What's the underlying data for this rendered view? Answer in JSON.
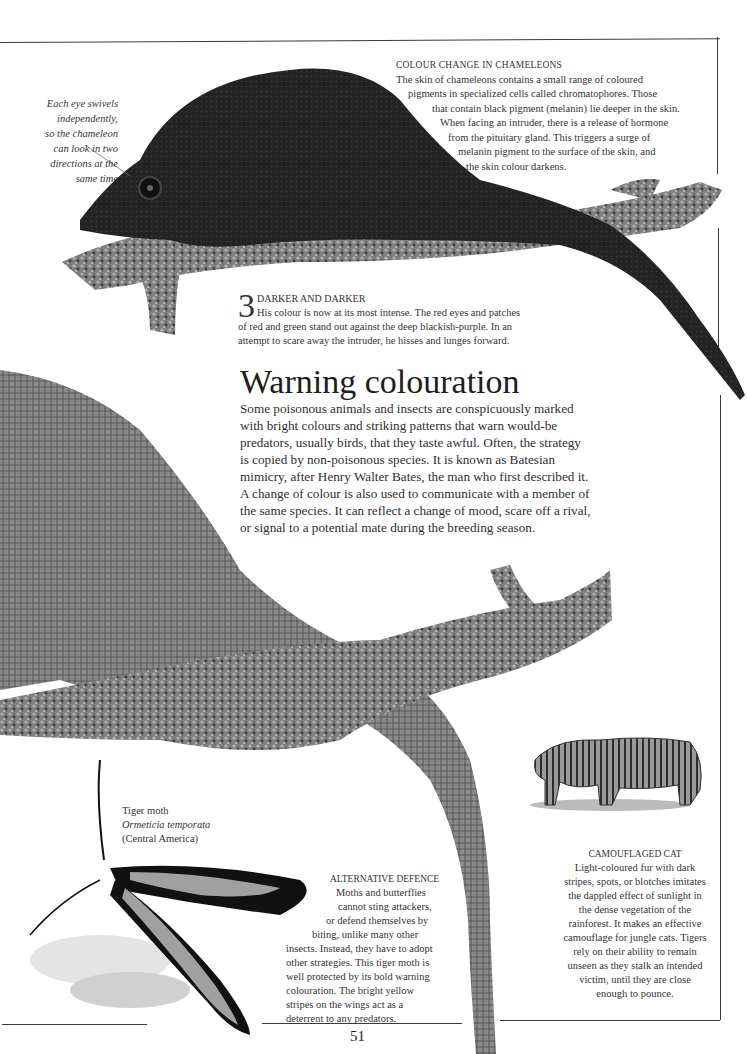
{
  "page": {
    "number": "51"
  },
  "eye_note": {
    "lines": [
      "Each eye swivels",
      "independently,",
      "so the chameleon",
      "can look in two",
      "directions at the",
      "same time"
    ]
  },
  "colour_change": {
    "heading": "COLOUR CHANGE IN CHAMELEONS",
    "lines": [
      "The skin of chameleons contains a small range of coloured",
      "pigments in specialized cells called chromatophores. Those",
      "that contain black pigment (melanin) lie deeper in the skin.",
      "When facing an intruder, there is a release of hormone",
      "from the pituitary gland. This triggers a surge of",
      "melanin pigment to the surface of the skin, and",
      "the skin colour darkens."
    ]
  },
  "darker": {
    "step_number": "3",
    "heading": "DARKER AND DARKER",
    "lines": [
      "His colour is now at its most intense. The red eyes and patches",
      "of red and green stand out against the deep blackish-purple. In an",
      "attempt to scare away the intruder, he hisses and lunges forward."
    ]
  },
  "warning": {
    "title": "Warning colouration",
    "lines": [
      "Some poisonous animals and insects are conspicuously marked",
      "with bright colours and striking patterns that warn would-be",
      "predators, usually birds, that they taste awful. Often, the strategy",
      "is copied by non-poisonous species. It is known as Batesian",
      "mimicry, after Henry Walter Bates, the man who first described it.",
      "A change of colour is also used to communicate with a member of",
      "the same species. It can reflect a change of mood, scare off a rival,",
      "or signal to a potential mate during the breeding season."
    ]
  },
  "moth_label": {
    "common_name": "Tiger moth",
    "scientific_name": "Ormeticia temporata",
    "region": "(Central America)"
  },
  "alternative_defence": {
    "heading": "ALTERNATIVE DEFENCE",
    "lines": [
      "Moths and butterflies",
      "cannot sting attackers,",
      "or defend themselves by",
      "biting, unlike many other",
      "insects. Instead, they have to adopt",
      "other strategies. This tiger moth is",
      "well protected by its bold warning",
      "colouration. The bright yellow",
      "stripes on the wings act as a",
      "deterrent to any predators."
    ]
  },
  "camouflaged_cat": {
    "heading": "CAMOUFLAGED CAT",
    "lines": [
      "Light-coloured fur with dark",
      "stripes, spots, or blotches imitates",
      "the dappled effect of sunlight in",
      "the dense vegetation of the",
      "rainforest. It makes an effective",
      "camouflage for jungle cats. Tigers",
      "rely on their ability to remain",
      "unseen as they stalk an intended",
      "victim, until they are close",
      "enough to pounce."
    ]
  },
  "colors": {
    "chameleon_dark": "#1f1f1f",
    "chameleon_grey": "#6b6b6b",
    "lichen": "#8a8a8a",
    "moth_black": "#111111",
    "moth_stripe": "#9a9a9a",
    "rule": "#3a3a3a"
  }
}
